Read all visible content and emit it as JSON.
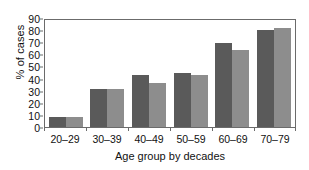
{
  "chart_data": {
    "type": "bar",
    "title": "",
    "xlabel": "Age group by decades",
    "ylabel": "% of cases",
    "categories": [
      "20–29",
      "30–39",
      "40–49",
      "50–59",
      "60–69",
      "70–79"
    ],
    "series": [
      {
        "name": "series-a",
        "color": "#5a5a5a",
        "values": [
          8,
          31,
          43,
          45,
          69,
          80
        ]
      },
      {
        "name": "series-b",
        "color": "#8d8d8d",
        "values": [
          8,
          31,
          36,
          43,
          64,
          82
        ]
      }
    ],
    "ylim": [
      0,
      90
    ],
    "ytick_labels": [
      "90",
      "80",
      "70",
      "60",
      "50",
      "40",
      "30",
      "20",
      "10",
      "0"
    ],
    "ytick_values": [
      90,
      80,
      70,
      60,
      50,
      40,
      30,
      20,
      10,
      0
    ],
    "grid": false,
    "legend": "none",
    "axis_color": "#6b6b6b",
    "background": "#ffffff"
  }
}
